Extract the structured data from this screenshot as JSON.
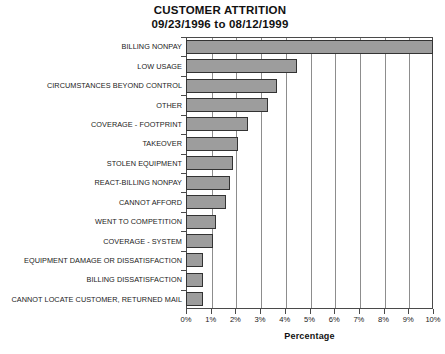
{
  "title": {
    "line1": "CUSTOMER ATTRITION",
    "line2": "09/23/1996 to 08/12/1999"
  },
  "axis": {
    "x_title": "Percentage",
    "x_ticks": [
      "0%",
      "1%",
      "2%",
      "3%",
      "4%",
      "5%",
      "6%",
      "7%",
      "8%",
      "9%",
      "10%"
    ]
  },
  "style": {
    "bar_fill": "#9d9d9d",
    "bar_border": "#333333",
    "grid_color": "#8d8d8d",
    "frame_color": "#4a4a4a"
  },
  "chart_data": {
    "type": "bar",
    "orientation": "horizontal",
    "title": "CUSTOMER ATTRITION 09/23/1996 to 08/12/1999",
    "xlabel": "Percentage",
    "ylabel": "",
    "xlim": [
      0,
      10
    ],
    "grid": true,
    "legend": "none",
    "categories": [
      "BILLING NONPAY",
      "LOW USAGE",
      "CIRCUMSTANCES BEYOND CONTROL",
      "OTHER",
      "COVERAGE - FOOTPRINT",
      "TAKEOVER",
      "STOLEN EQUIPMENT",
      "REACT-BILLING NONPAY",
      "CANNOT AFFORD",
      "WENT TO COMPETITION",
      "COVERAGE - SYSTEM",
      "EQUIPMENT DAMAGE OR DISSATISFACTION",
      "BILLING DISSATISFACTION",
      "CANNOT LOCATE CUSTOMER, RETURNED MAIL"
    ],
    "values": [
      10.0,
      4.5,
      3.7,
      3.3,
      2.5,
      2.1,
      1.9,
      1.8,
      1.6,
      1.2,
      1.1,
      0.7,
      0.7,
      0.7
    ],
    "tick_labels": [
      "0%",
      "1%",
      "2%",
      "3%",
      "4%",
      "5%",
      "6%",
      "7%",
      "8%",
      "9%",
      "10%"
    ]
  }
}
